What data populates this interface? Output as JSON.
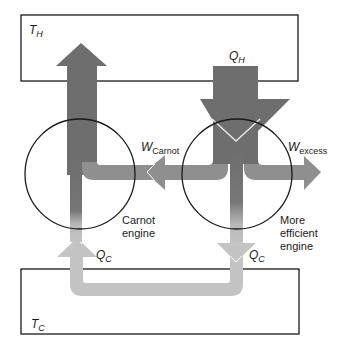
{
  "diagram": {
    "reservoirs": {
      "hot": {
        "symbol": "T",
        "subscript": "H"
      },
      "cold": {
        "symbol": "T",
        "subscript": "C"
      }
    },
    "labels": {
      "qh": {
        "symbol": "Q",
        "subscript": "H"
      },
      "qc_left": {
        "symbol": "Q",
        "subscript": "C"
      },
      "qc_right": {
        "symbol": "Q",
        "subscript": "C"
      },
      "w_carnot": {
        "symbol": "W",
        "subscript": "Carnot"
      },
      "w_excess": {
        "symbol": "W",
        "subscript": "excess"
      }
    },
    "engines": {
      "carnot": {
        "line1": "Carnot",
        "line2": "engine"
      },
      "efficient": {
        "line1": "More",
        "line2": "efficient",
        "line3": "engine"
      }
    },
    "colors": {
      "dark_arrow": "#6e6e6e",
      "light_arrow": "#c4c4c4",
      "mid_arrow": "#8f8f8f",
      "outline": "#1a1a1a",
      "background": "#ffffff"
    }
  }
}
